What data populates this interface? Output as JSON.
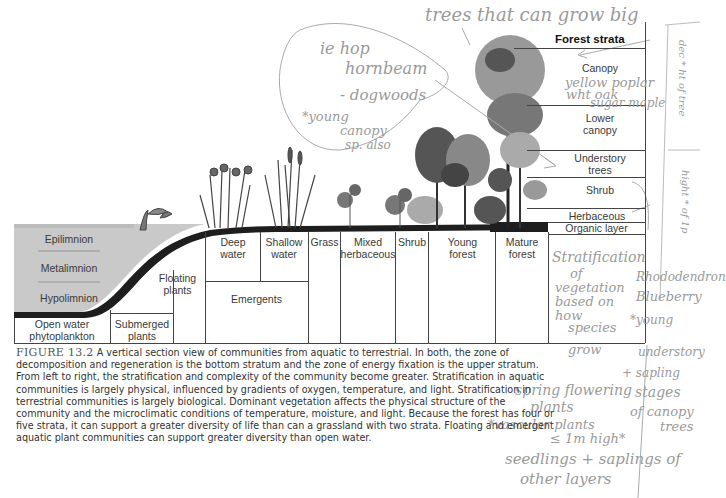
{
  "figure": {
    "number_label": "FIGURE 13.2",
    "caption": "A vertical section view of communities from aquatic to terrestrial. In both, the zone of decomposition and regeneration is the bottom stratum and the zone of energy fixation is the upper stratum. From left to right, the stratification and complexity of the community become greater. Stratification in aquatic communities is largely physical, influenced by gradients of oxygen, temperature, and light. Stratification in terrestrial communities is largely biological. Dominant vegetation affects the physical structure of the community and the microclimatic conditions of temperature, moisture, and light. Because the forest has four or five strata, it can support a greater diversity of life than can a grassland with two strata. Floating and emergent aquatic plant communities can support greater diversity than open water."
  },
  "lake_layers": [
    "Epilimnion",
    "Metalimnion",
    "Hypolimnion"
  ],
  "bottom_zones": {
    "open_water": "Open water phytoplankton",
    "submerged": "Submerged plants",
    "floating": "Floating plants",
    "deep_water": "Deep water",
    "shallow_water": "Shallow water",
    "emergents": "Emergents",
    "grass": "Grass",
    "mixed_herbaceous": "Mixed herbaceous",
    "shrub": "Shrub",
    "young_forest": "Young forest",
    "mature_forest": "Mature forest"
  },
  "forest_strata": {
    "title": "Forest strata",
    "layers": [
      "Canopy",
      "Lower canopy",
      "Understory trees",
      "Shrub",
      "Herbaceous",
      "Organic layer"
    ]
  },
  "handwritten_notes": {
    "top": "trees that can grow big",
    "circle_1": "ie hop",
    "circle_2": "hornbeam",
    "circle_3": "- dogwoods",
    "circle_4": "*young",
    "circle_5": "canopy",
    "circle_6": "sp. also",
    "canopy_note_1": "yellow poplar",
    "canopy_note_2": "wht oak",
    "canopy_note_3": "sugar maple",
    "side_box_top": "dec * ht of tree",
    "side_box_mid": "hight * of 1p",
    "strat_1": "Stratification",
    "strat_2": "of",
    "strat_3": "vegetation",
    "strat_4": "based on",
    "strat_5": "how",
    "strat_6": "species",
    "strat_7": "grow",
    "shrub_note_1": "Rhododendron",
    "shrub_note_2": "Blueberry",
    "shrub_note_3": "*young",
    "shrub_note_4": "understory",
    "shrub_note_5": "+ sapling",
    "shrub_note_6": "stages",
    "shrub_note_7": "of canopy",
    "shrub_note_8": "trees",
    "herb_note_1": "spring flowering",
    "herb_note_2": "plants",
    "herb_note_3": "*vascular plants",
    "herb_note_4": "≤ 1m high*",
    "herb_note_5": "seedlings + saplings of",
    "herb_note_6": "other layers"
  },
  "colors": {
    "water": "#c9c9c9",
    "ground": "#1e1e1e",
    "line": "#444444",
    "pencil": "#9a9a9a"
  }
}
